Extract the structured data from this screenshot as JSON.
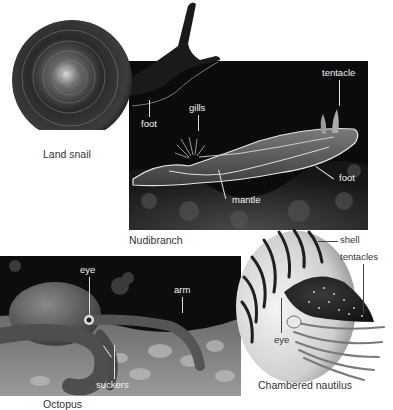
{
  "figure": {
    "organisms": [
      {
        "id": "land-snail",
        "caption": "Land snail",
        "labels": [
          {
            "text": "foot"
          }
        ]
      },
      {
        "id": "nudibranch",
        "caption": "Nudibranch",
        "labels": [
          {
            "text": "tentacle"
          },
          {
            "text": "gills"
          },
          {
            "text": "foot"
          },
          {
            "text": "mantle"
          }
        ]
      },
      {
        "id": "octopus",
        "caption": "Octopus",
        "labels": [
          {
            "text": "eye"
          },
          {
            "text": "arm"
          },
          {
            "text": "suckers"
          }
        ]
      },
      {
        "id": "chambered-nautilus",
        "caption": "Chambered nautilus",
        "labels": [
          {
            "text": "shell"
          },
          {
            "text": "tentacles"
          },
          {
            "text": "eye"
          }
        ]
      }
    ]
  },
  "colors": {
    "background": "#ffffff",
    "panel_dark": "#0b0b0b",
    "label_on_dark": "#f2f2f2",
    "label_on_light": "#333333",
    "leader_line": "#dddddd"
  }
}
